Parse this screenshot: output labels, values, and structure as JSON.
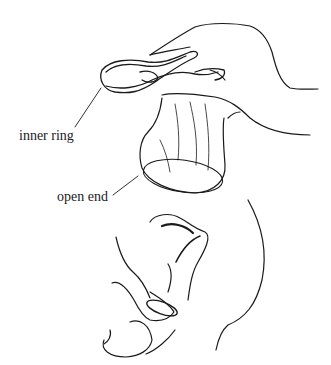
{
  "figure": {
    "type": "medical line illustration",
    "panels": [
      {
        "name": "hand-holding-condom",
        "description": "hand squeezing inner ring of female condom"
      },
      {
        "name": "insertion-cross-section",
        "description": "sagittal view of insertion"
      }
    ]
  },
  "labels": {
    "inner_ring": "inner ring",
    "open_end": "open end"
  },
  "colors": {
    "line": "#1a1a1a",
    "background": "#ffffff",
    "text": "#222222"
  }
}
